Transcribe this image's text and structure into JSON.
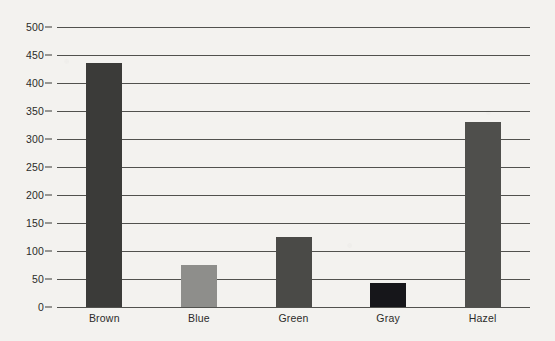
{
  "chart_data": {
    "type": "bar",
    "title": "",
    "subtitle": "",
    "xlabel": "",
    "ylabel": "",
    "categories": [
      "Brown",
      "Blue",
      "Green",
      "Gray",
      "Hazel"
    ],
    "values": [
      435,
      75,
      125,
      43,
      330
    ],
    "bar_colors": [
      "#3b3b39",
      "#8e8e8b",
      "#4a4a47",
      "#16161a",
      "#4f4f4c"
    ],
    "ylim": [
      0,
      500
    ],
    "yticks": [
      0,
      50,
      100,
      150,
      200,
      250,
      300,
      350,
      400,
      450,
      500
    ],
    "ytick_labels": [
      "0",
      "50",
      "100",
      "150",
      "200",
      "250",
      "300",
      "350",
      "400",
      "450",
      "500"
    ],
    "grid": true,
    "grid_axis": "y",
    "legend": false,
    "legend_position": "none",
    "background_color": "#f3f2ef",
    "grid_color": "#3a3a38",
    "axis_text_color": "#2b2b29"
  }
}
